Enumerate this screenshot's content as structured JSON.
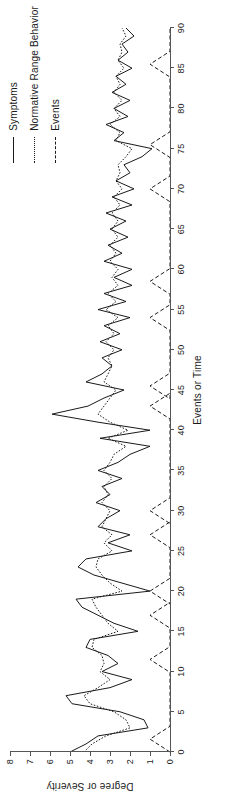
{
  "figure": {
    "rotation_note": "chart rendered landscape, page displays it rotated 90 degrees counter-clockwise"
  },
  "legend": {
    "position": "top-right",
    "items": [
      {
        "label": "Symptoms",
        "style": "solid"
      },
      {
        "label": "Normative Range Behavior",
        "style": "dotted"
      },
      {
        "label": "Events",
        "style": "dashed"
      }
    ]
  },
  "axes": {
    "x_title": "Events or Time",
    "y_title": "Degree or Severity",
    "x_ticks": [
      0,
      5,
      10,
      15,
      20,
      25,
      30,
      35,
      40,
      45,
      50,
      55,
      60,
      65,
      70,
      75,
      80,
      85,
      90
    ],
    "y_ticks": [
      0,
      1,
      2,
      3,
      4,
      5,
      6,
      7,
      8
    ]
  },
  "chart_data": {
    "type": "line",
    "title": "",
    "subtitle": "",
    "xlabel": "Events or Time",
    "ylabel": "Degree or Severity",
    "xlim": [
      0,
      90
    ],
    "ylim": [
      0,
      8
    ],
    "xticks": [
      0,
      5,
      10,
      15,
      20,
      25,
      30,
      35,
      40,
      45,
      50,
      55,
      60,
      65,
      70,
      75,
      80,
      85,
      90
    ],
    "yticks": [
      0,
      1,
      2,
      3,
      4,
      5,
      6,
      7,
      8
    ],
    "grid": false,
    "legend_position": "top right",
    "annotations": [],
    "series": [
      {
        "name": "Symptoms",
        "style": "solid",
        "color": "#1a1a1a",
        "x": [
          0,
          1,
          2,
          3,
          4,
          5,
          6,
          7,
          8,
          9,
          10,
          11,
          12,
          13,
          14,
          15,
          16,
          17,
          18,
          19,
          20,
          21,
          22,
          23,
          24,
          25,
          26,
          27,
          28,
          29,
          30,
          31,
          32,
          33,
          34,
          35,
          36,
          37,
          38,
          39,
          40,
          41,
          42,
          43,
          44,
          45,
          46,
          47,
          48,
          49,
          50,
          51,
          52,
          53,
          54,
          55,
          56,
          57,
          58,
          59,
          60,
          61,
          62,
          63,
          64,
          65,
          66,
          67,
          68,
          69,
          70,
          71,
          72,
          73,
          74,
          75,
          76,
          77,
          78,
          79,
          80,
          81,
          82,
          83,
          84,
          85,
          86,
          87,
          88,
          89,
          90
        ],
        "values": [
          5.0,
          4.2,
          3.6,
          1.1,
          1.3,
          2.5,
          4.9,
          5.2,
          3.0,
          1.9,
          3.4,
          2.6,
          3.1,
          4.2,
          4.0,
          1.6,
          2.8,
          3.6,
          4.4,
          4.7,
          1.0,
          2.4,
          3.8,
          4.6,
          4.2,
          1.9,
          3.1,
          2.0,
          3.6,
          3.2,
          2.5,
          3.7,
          3.0,
          3.4,
          2.4,
          3.6,
          2.6,
          2.0,
          1.0,
          3.5,
          1.0,
          3.6,
          5.9,
          4.1,
          3.3,
          2.3,
          4.2,
          3.4,
          2.9,
          3.4,
          2.4,
          3.5,
          2.5,
          3.3,
          2.0,
          3.6,
          2.2,
          3.3,
          1.9,
          2.8,
          1.9,
          3.3,
          2.4,
          3.1,
          2.1,
          3.0,
          2.2,
          3.2,
          1.9,
          2.9,
          1.8,
          2.7,
          2.0,
          2.3,
          1.4,
          0.9,
          2.8,
          2.3,
          3.2,
          2.1,
          2.8,
          2.0,
          2.9,
          2.2,
          2.7,
          1.9,
          2.6,
          2.1,
          2.4,
          1.8,
          2.2
        ]
      },
      {
        "name": "Normative Range Behavior",
        "style": "dotted",
        "color": "#1a1a1a",
        "x": [
          0,
          1,
          2,
          3,
          4,
          5,
          6,
          7,
          8,
          9,
          10,
          11,
          12,
          13,
          14,
          15,
          16,
          17,
          18,
          19,
          20,
          21,
          22,
          23,
          24,
          25,
          26,
          27,
          28,
          29,
          30,
          31,
          32,
          33,
          34,
          35,
          36,
          37,
          38,
          39,
          40,
          41,
          42,
          43,
          44,
          45,
          46,
          47,
          48,
          49,
          50,
          51,
          52,
          53,
          54,
          55,
          56,
          57,
          58,
          59,
          60,
          61,
          62,
          63,
          64,
          65,
          66,
          67,
          68,
          69,
          70,
          71,
          72,
          73,
          74,
          75,
          76,
          77,
          78,
          79,
          80,
          81,
          82,
          83,
          84,
          85,
          86,
          87,
          88,
          89,
          90
        ],
        "values": [
          4.3,
          3.9,
          3.2,
          2.0,
          2.2,
          2.8,
          4.0,
          4.3,
          3.6,
          3.0,
          3.5,
          3.3,
          3.4,
          3.9,
          3.8,
          2.6,
          3.1,
          3.4,
          3.7,
          3.9,
          2.4,
          3.0,
          3.4,
          3.7,
          3.6,
          2.9,
          3.3,
          2.9,
          3.4,
          3.2,
          3.0,
          3.4,
          3.1,
          3.3,
          2.9,
          3.3,
          3.0,
          2.8,
          2.2,
          3.1,
          2.1,
          3.0,
          3.6,
          3.3,
          3.0,
          2.7,
          3.3,
          3.1,
          2.9,
          3.1,
          2.8,
          3.2,
          2.8,
          3.1,
          2.6,
          3.2,
          2.7,
          3.1,
          2.6,
          2.9,
          2.6,
          3.0,
          2.7,
          3.0,
          2.6,
          2.9,
          2.6,
          2.9,
          2.5,
          2.8,
          2.4,
          2.7,
          2.5,
          2.6,
          2.2,
          1.9,
          2.7,
          2.5,
          3.0,
          2.5,
          2.8,
          2.4,
          2.8,
          2.5,
          2.7,
          2.3,
          2.6,
          2.4,
          2.5,
          2.2,
          2.4
        ]
      },
      {
        "name": "Events",
        "style": "dashed",
        "color": "#1a1a1a",
        "description": "discrete event spikes rising from the baseline to about 1 on the severity scale",
        "spikes": [
          1.6,
          11.5,
          17.0,
          20.0,
          27.0,
          30.0,
          43.0,
          45.5,
          54.0,
          58.5,
          70.0,
          75.5,
          85.5
        ],
        "spike_height": 1.0,
        "baseline": 0.0
      }
    ]
  }
}
